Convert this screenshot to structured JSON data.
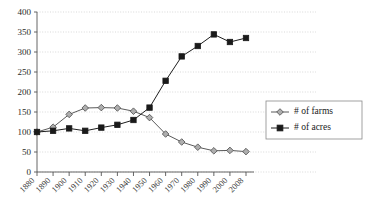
{
  "chart_data": {
    "type": "line",
    "title": "",
    "subtitle": "",
    "xlabel": "",
    "ylabel": "",
    "ylim": [
      0,
      400
    ],
    "ytick_step": 50,
    "grid": true,
    "legend_position": "right",
    "x": [
      1880,
      1890,
      1900,
      1910,
      1920,
      1930,
      1940,
      1950,
      1960,
      1970,
      1980,
      1990,
      2000,
      2008
    ],
    "categories": [
      "1880",
      "1890",
      "1900",
      "1910",
      "1920",
      "1930",
      "1940",
      "1950",
      "1960",
      "1970",
      "1980",
      "1990",
      "2000",
      "2008"
    ],
    "ytick_labels": [
      "0",
      "50",
      "100",
      "150",
      "200",
      "250",
      "300",
      "350",
      "400"
    ],
    "ytick_values": [
      0,
      50,
      100,
      150,
      200,
      250,
      300,
      350,
      400
    ],
    "series": [
      {
        "name": "# of farms",
        "marker": "diamond",
        "color": "#aeaeae",
        "line_color": "#5a5a5a",
        "values": [
          100,
          112,
          144,
          160,
          161,
          160,
          152,
          136,
          95,
          75,
          62,
          53,
          54,
          51
        ]
      },
      {
        "name": "# of acres",
        "marker": "square",
        "color": "#1a1a1a",
        "line_color": "#1e1e1e",
        "values": [
          100,
          103,
          109,
          103,
          111,
          118,
          130,
          161,
          228,
          289,
          315,
          344,
          325,
          335
        ]
      }
    ],
    "legend": [
      {
        "label": "# of farms",
        "marker": "diamond"
      },
      {
        "label": "# of acres",
        "marker": "square"
      }
    ]
  },
  "colors": {
    "background": "#ffffff",
    "grid": "#c9c9c9",
    "axis": "#555555",
    "farms_marker": "#aeaeae",
    "acres_marker": "#1a1a1a",
    "legend_border": "#8a8a8a"
  }
}
